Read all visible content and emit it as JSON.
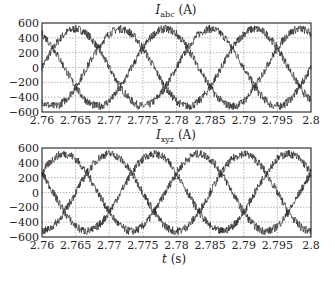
{
  "chart_data": [
    {
      "type": "line",
      "title": "I_abc (A)",
      "title_main": "I",
      "title_sub": "abc",
      "title_unit": "(A)",
      "xlabel": "",
      "ylabel": "",
      "xlim": [
        2.76,
        2.8
      ],
      "ylim": [
        -600,
        600
      ],
      "xticks": [
        "2.76",
        "2.765",
        "2.77",
        "2.775",
        "2.78",
        "2.785",
        "2.79",
        "2.795",
        "2.8"
      ],
      "yticks": [
        "600",
        "400",
        "200",
        "0",
        "-200",
        "-400",
        "-600"
      ],
      "grid": true,
      "series": [
        {
          "name": "phase a",
          "amplitude": 520,
          "frequency_hz": 50,
          "phase_deg": 0,
          "noise": "high"
        },
        {
          "name": "phase b",
          "amplitude": 520,
          "frequency_hz": 50,
          "phase_deg": -120,
          "noise": "high"
        },
        {
          "name": "phase c",
          "amplitude": 520,
          "frequency_hz": 50,
          "phase_deg": 120,
          "noise": "high"
        }
      ]
    },
    {
      "type": "line",
      "title": "I_xyz (A)",
      "title_main": "I",
      "title_sub": "xyz",
      "title_unit": "(A)",
      "xlabel": "t (s)",
      "ylabel": "",
      "xlim": [
        2.76,
        2.8
      ],
      "ylim": [
        -600,
        600
      ],
      "xticks": [
        "2.76",
        "2.765",
        "2.77",
        "2.775",
        "2.78",
        "2.785",
        "2.79",
        "2.795",
        "2.8"
      ],
      "yticks": [
        "600",
        "400",
        "200",
        "0",
        "-200",
        "-400",
        "-600"
      ],
      "grid": true,
      "series": [
        {
          "name": "phase x",
          "amplitude": 520,
          "frequency_hz": 50,
          "phase_deg": 30,
          "noise": "high"
        },
        {
          "name": "phase y",
          "amplitude": 520,
          "frequency_hz": 50,
          "phase_deg": -90,
          "noise": "high"
        },
        {
          "name": "phase z",
          "amplitude": 520,
          "frequency_hz": 50,
          "phase_deg": 150,
          "noise": "high"
        }
      ]
    }
  ],
  "labels": {
    "top_title_main": "I",
    "top_title_sub": "abc",
    "top_title_unit": "(A)",
    "bottom_title_main": "I",
    "bottom_title_sub": "xyz",
    "bottom_title_unit": "(A)",
    "xlabel_var": "t",
    "xlabel_unit": "(s)"
  },
  "colors": {
    "line": "#2a2a2a",
    "grid": "#9a9a9a",
    "frame": "#222222"
  }
}
